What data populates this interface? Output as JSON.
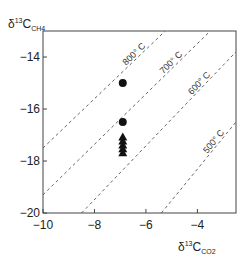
{
  "chart_data": {
    "type": "scatter",
    "title": "",
    "xlabel": "δ13C CO2",
    "ylabel": "δ13C CH4",
    "xlabel_parts": {
      "delta": "δ",
      "sup": "13",
      "main": "C",
      "sub": "CO2"
    },
    "ylabel_parts": {
      "delta": "δ",
      "sup": "13",
      "main": "C",
      "sub": "CH4"
    },
    "xlim": [
      -10,
      -2.5
    ],
    "ylim": [
      -20,
      -13
    ],
    "x_ticks": [
      -10,
      -8,
      -6,
      -4
    ],
    "x_tick_labels": [
      "−10",
      "−8",
      "−6",
      "−4"
    ],
    "y_ticks": [
      -14,
      -16,
      -18,
      -20
    ],
    "y_tick_labels": [
      "−14",
      "−16",
      "−18",
      "−20"
    ],
    "grid": false,
    "series": [
      {
        "name": "circles",
        "marker": "circle",
        "points": [
          [
            -6.9,
            -15.0
          ],
          [
            -6.9,
            -16.5
          ]
        ]
      },
      {
        "name": "triangles",
        "marker": "triangle",
        "points": [
          [
            -6.9,
            -17.1
          ],
          [
            -6.9,
            -17.25
          ],
          [
            -6.9,
            -17.4
          ],
          [
            -6.9,
            -17.55
          ],
          [
            -6.9,
            -17.7
          ]
        ]
      }
    ],
    "isotherms": [
      {
        "label": "800° C",
        "from": [
          -10,
          -17.5
        ],
        "to": [
          -5.25,
          -13
        ]
      },
      {
        "label": "700° C",
        "from": [
          -10,
          -19.3
        ],
        "to": [
          -3.5,
          -13
        ]
      },
      {
        "label": "600° C",
        "from": [
          -8.5,
          -20
        ],
        "to": [
          -2.5,
          -13.8
        ]
      },
      {
        "label": "500° C",
        "from": [
          -5.4,
          -20
        ],
        "to": [
          -2.5,
          -16.5
        ]
      }
    ]
  }
}
